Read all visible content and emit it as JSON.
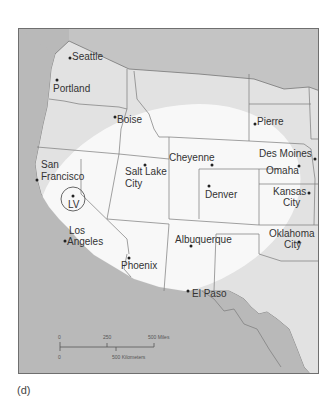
{
  "figure": {
    "label": "(d)"
  },
  "map": {
    "colors": {
      "ocean_foreign": "#b9b9b9",
      "land_us": "#e3e3e3",
      "highlight_zone": "#fafafa",
      "borders": "#7a7a7a",
      "text": "#333333"
    },
    "marker": {
      "label": "LV",
      "description": "circled location"
    },
    "cities": [
      {
        "name": "Seattle"
      },
      {
        "name": "Portland"
      },
      {
        "name": "Boise"
      },
      {
        "name": "Pierre"
      },
      {
        "name": "San Francisco",
        "line1": "San",
        "line2": "Francisco"
      },
      {
        "name": "Salt Lake City",
        "line1": "Salt Lake",
        "line2": "City"
      },
      {
        "name": "Cheyenne"
      },
      {
        "name": "Des Moines"
      },
      {
        "name": "Omaha"
      },
      {
        "name": "Denver"
      },
      {
        "name": "Kansas City",
        "line1": "Kansas",
        "line2": "City"
      },
      {
        "name": "Los Angeles",
        "line1": "Los",
        "line2": "Angeles"
      },
      {
        "name": "Albuquerque"
      },
      {
        "name": "Oklahoma City",
        "line1": "Oklahoma",
        "line2": "City"
      },
      {
        "name": "Phoenix"
      },
      {
        "name": "El Paso"
      }
    ],
    "scale_bar": {
      "miles": {
        "start": "0",
        "mid": "250",
        "end": "500 Miles"
      },
      "kilometers": {
        "start": "0",
        "end": "500 Kilometers"
      }
    }
  }
}
